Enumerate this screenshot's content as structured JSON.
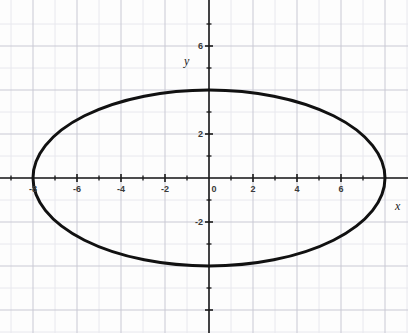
{
  "chart_data": {
    "type": "line",
    "title": "",
    "subtitle": "",
    "xlabel": "x",
    "ylabel": "y",
    "xlim": [
      -9.5,
      9
    ],
    "ylim": [
      -7,
      7
    ],
    "grid": true,
    "grid_major_step": 2,
    "grid_minor_step": 1,
    "legend": "none",
    "curve": {
      "name": "ellipse",
      "equation": "x^2/64 + y^2/16 = 1",
      "center": [
        0,
        0
      ],
      "semi_axis_x": 8,
      "semi_axis_y": 4,
      "vertices": [
        [
          -8,
          0
        ],
        [
          8,
          0
        ],
        [
          0,
          4
        ],
        [
          0,
          -4
        ]
      ],
      "color": "#111111",
      "line_width": 3
    },
    "x_ticks": [
      -8,
      -6,
      -4,
      -2,
      0,
      2,
      4,
      6
    ],
    "x_tick_labels": [
      "-8",
      "-6",
      "-4",
      "-2",
      "0",
      "2",
      "4",
      "6"
    ],
    "y_ticks": [
      6,
      4,
      2,
      -2,
      -4
    ],
    "y_tick_labels": [
      "6",
      "4",
      "2",
      "-2",
      "-4"
    ],
    "y_visible_tick_values": [
      6,
      2,
      -2
    ],
    "y_visible_tick_labels": [
      "6",
      "2",
      "-2"
    ],
    "axis_color": "#1a1a1a",
    "grid_major_color": "#c9c9d4",
    "grid_minor_color": "#e8e8ee",
    "background_color": "#fdfdfd"
  },
  "axes": {
    "x_name": "x",
    "y_name": "y"
  },
  "ticks": {
    "x": [
      {
        "value": -8,
        "label": "-8"
      },
      {
        "value": -6,
        "label": "-6"
      },
      {
        "value": -4,
        "label": "-4"
      },
      {
        "value": -2,
        "label": "-2"
      },
      {
        "value": 0,
        "label": "0"
      },
      {
        "value": 2,
        "label": "2"
      },
      {
        "value": 4,
        "label": "4"
      },
      {
        "value": 6,
        "label": "6"
      }
    ],
    "y": [
      {
        "value": 6,
        "label": "6"
      },
      {
        "value": 2,
        "label": "2"
      },
      {
        "value": -2,
        "label": "-2"
      }
    ]
  }
}
